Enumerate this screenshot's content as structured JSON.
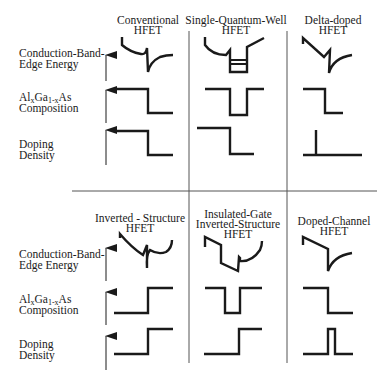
{
  "row_labels": {
    "conduction_band": [
      "Conduction-Band-",
      "Edge Energy"
    ],
    "composition": {
      "al": "Al",
      "x": "x",
      "ga": "Ga",
      "one_minus_x": "1-x",
      "as": "As",
      "line2": "Composition"
    },
    "doping": [
      "Doping",
      "Density"
    ]
  },
  "panels": [
    {
      "id": "conventional",
      "title": [
        "Conventional",
        "HFET"
      ]
    },
    {
      "id": "single-quantum-well",
      "title": [
        "Single-Quantum-Well",
        "HFET"
      ]
    },
    {
      "id": "delta-doped",
      "title": [
        "Delta-doped",
        "HFET"
      ]
    },
    {
      "id": "inverted-structure",
      "title": [
        "Inverted - Structure",
        "HFET"
      ]
    },
    {
      "id": "insulated-gate-inverted-structure",
      "title": [
        "Insulated-Gate",
        "Inverted-Structure",
        "HFET"
      ]
    },
    {
      "id": "doped-channel",
      "title": [
        "Doped-Channel",
        "HFET"
      ]
    }
  ],
  "colors": {
    "line": "#1a1a1a",
    "grid": "#555555"
  }
}
